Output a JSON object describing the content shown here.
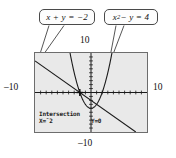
{
  "figure": {
    "kind": "graphing-calculator-screenshot"
  },
  "callouts": [
    {
      "id": "line-equation",
      "base": "x + y = −2",
      "lhs": "x + y",
      "rhs": "−2"
    },
    {
      "id": "parabola-equation",
      "base": "x",
      "exponent": "2",
      "tail": " − y = 4"
    }
  ],
  "axes": {
    "top_label": "10",
    "bottom_label": "–10",
    "left_label": "–10",
    "right_label": "10",
    "xmin": -10,
    "xmax": 10,
    "ymin": -10,
    "ymax": 10,
    "xscl": 1,
    "yscl": 1
  },
  "readout": {
    "title": "Intersection",
    "x_value": "X=ˉ2",
    "y_value": "Y=0"
  },
  "colors": {
    "screen_background": "#e9e9e9",
    "screen_border": "#6d6d6d",
    "curve": "#1a1a1a",
    "callout_border": "#4a4a4a",
    "callout_background": "#fdfdfd",
    "page_background": "#ffffff"
  },
  "chart_data": {
    "type": "line",
    "title": "",
    "xlabel": "",
    "ylabel": "",
    "xlim": [
      -10,
      10
    ],
    "ylim": [
      -10,
      10
    ],
    "grid": false,
    "tick_marks": true,
    "series": [
      {
        "name": "x + y = -2",
        "equation_solved": "y = -x - 2",
        "kind": "line",
        "points": [
          [
            -10,
            8
          ],
          [
            -6,
            4
          ],
          [
            -2,
            0
          ],
          [
            0,
            -2
          ],
          [
            4,
            -6
          ],
          [
            8,
            -10
          ]
        ]
      },
      {
        "name": "x^2 - y = 4",
        "equation_solved": "y = x^2 - 4",
        "kind": "parabola",
        "vertex": [
          0,
          -4
        ],
        "points": [
          [
            -3.74,
            10
          ],
          [
            -3,
            5
          ],
          [
            -2,
            0
          ],
          [
            -1,
            -3
          ],
          [
            0,
            -4
          ],
          [
            1,
            -3
          ],
          [
            2,
            0
          ],
          [
            3,
            5
          ],
          [
            3.74,
            10
          ]
        ]
      }
    ],
    "intersections": [
      {
        "x": -2,
        "y": 0,
        "labeled": true
      },
      {
        "x": 1,
        "y": -3,
        "labeled": false
      }
    ],
    "cursor": {
      "x": -2,
      "y": 0,
      "style": "crosshair"
    },
    "annotations": [
      {
        "text": "x + y = −2",
        "target_series": "x + y = -2"
      },
      {
        "text": "x² − y = 4",
        "target_series": "x^2 - y = 4"
      },
      {
        "text": "Intersection",
        "position": "screen-bottom-left"
      },
      {
        "text": "X=ˉ2",
        "position": "screen-bottom-left"
      },
      {
        "text": "Y=0",
        "position": "screen-bottom-center"
      }
    ]
  }
}
